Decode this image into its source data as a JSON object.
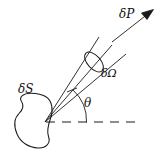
{
  "figure": {
    "type": "physics-diagram",
    "background_color": "#ffffff",
    "stroke_color": "#1a1a1a",
    "width": 162,
    "height": 162,
    "labels": {
      "surface_element": "δS",
      "solid_angle": "δΩ",
      "power": "δP",
      "angle": "θ"
    },
    "elements": {
      "blob_name": "surface-element-blob",
      "cone_name": "solid-angle-cone",
      "cap_name": "solid-angle-cap-ellipse",
      "axis_name": "cone-axis-line",
      "arrow_name": "power-flux-arrow",
      "dashed_name": "horizontal-reference-dashed-line",
      "arc_name": "theta-angle-arc"
    },
    "geometry": {
      "apex": [
        45,
        122
      ],
      "cone_upper_end": [
        99,
        37
      ],
      "cone_lower_end": [
        126,
        54
      ],
      "axis_end": [
        112,
        45
      ],
      "cap_center": [
        94,
        62
      ],
      "arrow_tail": [
        112,
        42
      ],
      "arrow_tip": [
        153,
        10
      ],
      "dash_start": [
        46,
        122
      ],
      "dash_end": [
        137,
        122
      ],
      "theta_arc_radius": 40
    }
  }
}
